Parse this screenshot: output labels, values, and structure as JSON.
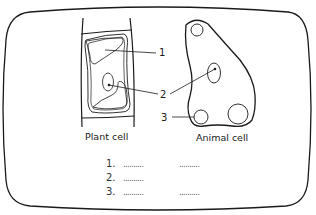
{
  "diagram": {
    "plant_cell": {
      "caption": "Plant cell"
    },
    "animal_cell": {
      "caption": "Animal cell"
    },
    "labels": [
      {
        "number": "1"
      },
      {
        "number": "2"
      },
      {
        "number": "3"
      }
    ],
    "answers": [
      {
        "number": "1.",
        "blank_left": "..........",
        "blank_right": ".........."
      },
      {
        "number": "2.",
        "blank_left": ".........."
      },
      {
        "number": "3.",
        "blank_left": "..........",
        "blank_right": ".........."
      }
    ]
  },
  "colors": {
    "ink": "#1a1a1a",
    "background": "#ffffff"
  }
}
